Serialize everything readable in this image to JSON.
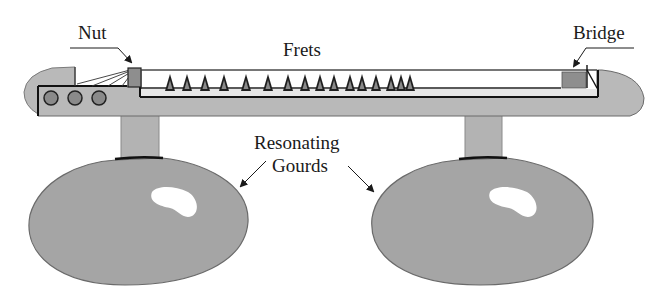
{
  "diagram": {
    "labels": {
      "nut": "Nut",
      "frets": "Frets",
      "bridge": "Bridge",
      "gourds_line1": "Resonating",
      "gourds_line2": "Gourds"
    },
    "components": {
      "tuning_pegs": 3,
      "fret_count": 16,
      "gourd_count": 2
    },
    "fret_x_positions": [
      170,
      187,
      205,
      224,
      246,
      268,
      288,
      305,
      320,
      334,
      350,
      362,
      376,
      391,
      401,
      410
    ],
    "colors": {
      "body_fill": "#b9b9b9",
      "gourd_fill": "#a3a3a3",
      "stroke": "#2a2a2a",
      "highlight": "#ffffff",
      "fret_fill": "#8a8a8a"
    }
  }
}
